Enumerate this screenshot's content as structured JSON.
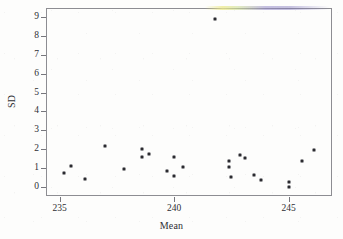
{
  "chart_data": {
    "type": "scatter",
    "title": "",
    "xlabel": "Mean",
    "ylabel": "SD",
    "xlim": [
      234.4,
      246.9
    ],
    "ylim": [
      -0.45,
      9.45
    ],
    "grid": false,
    "legend": "none",
    "x_ticks": [
      235,
      240,
      245
    ],
    "x_tick_labels": [
      "235",
      "240",
      "245"
    ],
    "y_ticks": [
      0,
      1,
      2,
      3,
      4,
      5,
      6,
      7,
      8,
      9
    ],
    "y_tick_labels": [
      "0",
      "1",
      "2",
      "3",
      "4",
      "5",
      "6",
      "7",
      "8",
      "9"
    ],
    "marker": "square",
    "marker_color": "#2b2b30",
    "marker_size": 3,
    "series": [
      {
        "name": "Mean vs SD",
        "points": [
          {
            "x": 235.2,
            "y": 0.78
          },
          {
            "x": 235.5,
            "y": 1.13
          },
          {
            "x": 236.1,
            "y": 0.46
          },
          {
            "x": 237.0,
            "y": 2.2
          },
          {
            "x": 237.8,
            "y": 0.96
          },
          {
            "x": 238.6,
            "y": 2.01
          },
          {
            "x": 238.6,
            "y": 1.63
          },
          {
            "x": 238.9,
            "y": 1.78
          },
          {
            "x": 239.7,
            "y": 0.88
          },
          {
            "x": 240.0,
            "y": 1.63
          },
          {
            "x": 240.0,
            "y": 0.6
          },
          {
            "x": 240.4,
            "y": 1.09
          },
          {
            "x": 241.8,
            "y": 8.88
          },
          {
            "x": 242.4,
            "y": 1.38
          },
          {
            "x": 242.4,
            "y": 1.08
          },
          {
            "x": 242.5,
            "y": 0.54
          },
          {
            "x": 242.9,
            "y": 1.7
          },
          {
            "x": 243.1,
            "y": 1.53
          },
          {
            "x": 243.5,
            "y": 0.64
          },
          {
            "x": 243.8,
            "y": 0.38
          },
          {
            "x": 245.0,
            "y": 0.28
          },
          {
            "x": 245.0,
            "y": 0.05
          },
          {
            "x": 245.6,
            "y": 1.39
          },
          {
            "x": 246.1,
            "y": 1.96
          }
        ]
      }
    ]
  }
}
